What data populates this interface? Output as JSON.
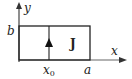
{
  "diagram": {
    "labels": {
      "y_axis": "y",
      "x_axis": "x",
      "height": "b",
      "width": "a",
      "position": "x",
      "position_sub": "0",
      "current": "J"
    },
    "colors": {
      "stroke": "#222222",
      "axis": "#555555"
    }
  }
}
